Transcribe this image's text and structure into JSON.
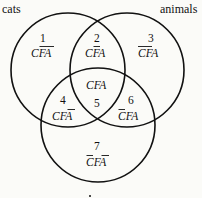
{
  "diagram": {
    "type": "venn-3-set",
    "sets": [
      {
        "id": "C",
        "label": "cats"
      },
      {
        "id": "A",
        "label": "animals"
      },
      {
        "id": "F",
        "label": ""
      }
    ],
    "regions": [
      {
        "number": "1",
        "letters": [
          "C",
          "F",
          "A"
        ],
        "negated": [
          false,
          true,
          true
        ]
      },
      {
        "number": "2",
        "letters": [
          "C",
          "F",
          "A"
        ],
        "negated": [
          false,
          true,
          false
        ]
      },
      {
        "number": "3",
        "letters": [
          "C",
          "F",
          "A"
        ],
        "negated": [
          true,
          true,
          false
        ]
      },
      {
        "number": "4",
        "letters": [
          "C",
          "F",
          "A"
        ],
        "negated": [
          false,
          false,
          true
        ]
      },
      {
        "number": "5",
        "letters": [
          "C",
          "F",
          "A"
        ],
        "negated": [
          false,
          false,
          false
        ]
      },
      {
        "number": "6",
        "letters": [
          "C",
          "F",
          "A"
        ],
        "negated": [
          true,
          false,
          false
        ]
      },
      {
        "number": "7",
        "letters": [
          "C",
          "F",
          "A"
        ],
        "negated": [
          true,
          false,
          true
        ]
      }
    ]
  },
  "labels": {
    "cats": "cats",
    "animals": "animals"
  }
}
